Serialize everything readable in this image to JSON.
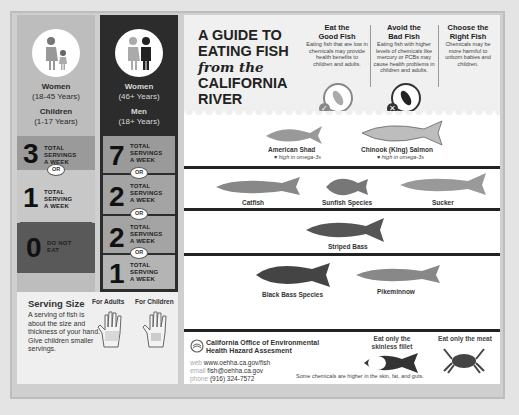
{
  "columns": [
    {
      "groups": [
        {
          "title": "Women",
          "range": "(18-45 Years)"
        },
        {
          "title": "Children",
          "range": "(1-17 Years)"
        }
      ],
      "rows": [
        {
          "number": "3",
          "label": [
            "TOTAL",
            "SERVINGS",
            "A WEEK"
          ],
          "color": "#9a9a9a"
        },
        {
          "number": "1",
          "label": [
            "TOTAL",
            "SERVING",
            "A WEEK"
          ],
          "color": "#c8c8c8"
        },
        {
          "number": "0",
          "label": [
            "DO NOT",
            "EAT"
          ],
          "color": "#595959"
        },
        {
          "number": "0",
          "label": [
            "DO NOT",
            "EAT"
          ],
          "color": "#595959"
        }
      ],
      "or_label": "OR"
    },
    {
      "groups": [
        {
          "title": "Women",
          "range": "(46+ Years)"
        },
        {
          "title": "Men",
          "range": "(18+ Years)"
        }
      ],
      "rows": [
        {
          "number": "7",
          "label": [
            "TOTAL",
            "SERVINGS",
            "A WEEK"
          ],
          "color": "#9a9a9a"
        },
        {
          "number": "2",
          "label": [
            "TOTAL",
            "SERVINGS",
            "A WEEK"
          ],
          "color": "#a4a4a4"
        },
        {
          "number": "2",
          "label": [
            "TOTAL",
            "SERVINGS",
            "A WEEK"
          ],
          "color": "#a4a4a4"
        },
        {
          "number": "1",
          "label": [
            "TOTAL",
            "SERVING",
            "A WEEK"
          ],
          "color": "#b4b4b4"
        }
      ],
      "or_label": "OR"
    }
  ],
  "serving_size": {
    "title": "Serving Size",
    "description": "A serving of fish is about the size and thickness of your hand. Give children smaller servings.",
    "for_adults": "For Adults",
    "for_children": "For Children"
  },
  "header": {
    "title_line1": "A GUIDE TO",
    "title_line2": "EATING FISH",
    "title_script": "from the",
    "title_line3": "CALIFORNIA",
    "title_line4": "RIVER",
    "info": [
      {
        "heading1": "Eat the",
        "heading2": "Good Fish",
        "text": "Eating fish that are low in chemicals may provide health benefits to children and adults."
      },
      {
        "heading1": "Avoid the",
        "heading2": "Bad Fish",
        "text": "Eating fish with higher levels of chemicals like mercury or PCBs may cause health problems in children and adults."
      },
      {
        "heading1": "Choose the",
        "heading2": "Right Fish",
        "text": "Chemicals may be more harmful to unborn babies and children."
      }
    ]
  },
  "fish_rows": [
    {
      "fish": [
        {
          "name": "American Shad",
          "note": "♥ high in omega-3s"
        },
        {
          "name": "Chinook (King) Salmon",
          "note": "♥ high in omega-3s"
        }
      ]
    },
    {
      "fish": [
        {
          "name": "Catfish"
        },
        {
          "name": "Sunfish Species"
        },
        {
          "name": "Sucker"
        }
      ]
    },
    {
      "fish": [
        {
          "name": "Striped Bass"
        }
      ]
    },
    {
      "fish": [
        {
          "name": "Black Bass Species"
        },
        {
          "name": "Pikeminnow"
        }
      ]
    }
  ],
  "footer": {
    "org_line1": "California Office of Environmental",
    "org_line2": "Health Hazard Assesment",
    "web_key": "web",
    "web": "www.oehha.ca.gov/fish",
    "email_key": "email",
    "email": "fish@oehha.ca.gov",
    "phone_key": "phone",
    "phone": "(916) 324-7572",
    "fillet_label_1": "Eat only the",
    "fillet_label_2": "skinless fillet",
    "meat_label": "Eat only the meat",
    "chem_note": "Some chemicals are higher in the skin, fat, and guts."
  }
}
